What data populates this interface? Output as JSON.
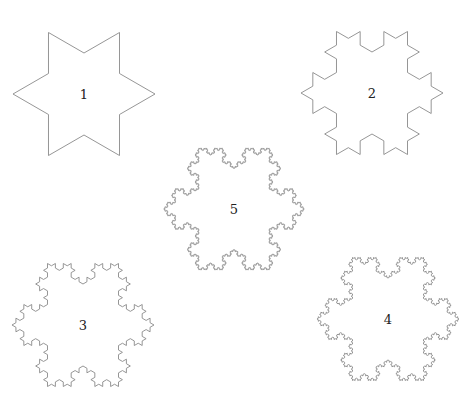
{
  "figure": {
    "stroke_color": "#8a8a8a",
    "background": "#ffffff",
    "snowflakes": [
      {
        "label": "1",
        "level": 1,
        "cx": 84,
        "cy": 94,
        "r": 82,
        "rotation": -90
      },
      {
        "label": "2",
        "level": 2,
        "cx": 372,
        "cy": 93,
        "r": 82,
        "rotation": -90
      },
      {
        "label": "5",
        "level": 5,
        "cx": 234,
        "cy": 209,
        "r": 81,
        "rotation": -90
      },
      {
        "label": "3",
        "level": 3,
        "cx": 83,
        "cy": 325,
        "r": 82,
        "rotation": -90
      },
      {
        "label": "4",
        "level": 4,
        "cx": 388,
        "cy": 319,
        "r": 82,
        "rotation": -90
      }
    ]
  }
}
